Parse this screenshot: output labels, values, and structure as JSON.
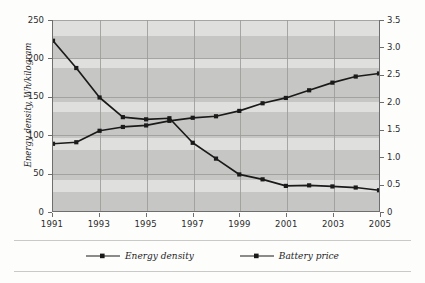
{
  "chart_data": {
    "type": "line",
    "title": "",
    "xlabel": "",
    "ylabel": "Energy density, Wh/kilogram",
    "y2label": "Price, US$/Wh",
    "grid": true,
    "legend_position": "bottom",
    "x": [
      1991,
      1992,
      1993,
      1994,
      1995,
      1996,
      1997,
      1998,
      1999,
      2000,
      2001,
      2002,
      2003,
      2004,
      2005
    ],
    "xtick_labels": [
      "1991",
      "1993",
      "1995",
      "1997",
      "1999",
      "2001",
      "2003",
      "2005"
    ],
    "xtick_values": [
      1991,
      1993,
      1995,
      1997,
      1999,
      2001,
      2003,
      2005
    ],
    "xlim": [
      1991,
      2005
    ],
    "ylim": [
      0,
      250
    ],
    "ytick_labels": [
      "0",
      "50",
      "100",
      "150",
      "200",
      "250"
    ],
    "ytick_values": [
      0,
      50,
      100,
      150,
      200,
      250
    ],
    "y2lim": [
      0,
      3.5
    ],
    "y2tick_labels": [
      "0",
      "0.5",
      "1.0",
      "1.5",
      "2.0",
      "2.5",
      "3.0",
      "3.5"
    ],
    "y2tick_values": [
      0,
      0.5,
      1.0,
      1.5,
      2.0,
      2.5,
      3.0,
      3.5
    ],
    "series": [
      {
        "name": "Energy density",
        "axis": "left",
        "unit": "Wh/kilogram",
        "marker": "square",
        "color": "#1a1a1a",
        "values": [
          88,
          90,
          105,
          110,
          112,
          118,
          122,
          124,
          131,
          141,
          148,
          158,
          168,
          176,
          180
        ]
      },
      {
        "name": "Battery price",
        "axis": "right",
        "unit": "US$/Wh",
        "marker": "square",
        "color": "#1a1a1a",
        "values": [
          3.12,
          2.62,
          2.08,
          1.72,
          1.68,
          1.7,
          1.25,
          0.96,
          0.67,
          0.58,
          0.46,
          0.47,
          0.45,
          0.43,
          0.38
        ]
      }
    ]
  },
  "legend": {
    "items": [
      {
        "label": "Energy density"
      },
      {
        "label": "Battery price"
      }
    ]
  },
  "axes": {
    "left_title": "Energy density, Wh/kilogram",
    "right_title": "Price, US$/Wh"
  },
  "colors": {
    "plot_background": "#d6d6d4",
    "band_light": "#dfdfdd",
    "band_dark": "#c6c6c4",
    "gridline": "#9b9b99",
    "axis": "#6e6e6e",
    "series": "#1a1a1a",
    "text": "#1f1f1f",
    "page_background": "#fdfdfc"
  }
}
